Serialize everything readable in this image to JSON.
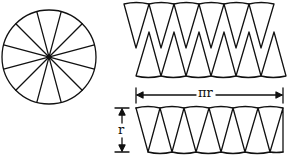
{
  "figure": {
    "sector_count": 12,
    "labels": {
      "width": "πr",
      "height": "r"
    }
  }
}
